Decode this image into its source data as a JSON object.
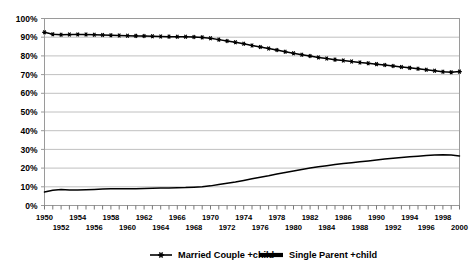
{
  "chart_data": {
    "type": "line",
    "title": "",
    "subtitle": "",
    "xlabel": "",
    "ylabel": "",
    "grid": true,
    "legend_position": "bottom",
    "xlim": [
      1950,
      2000
    ],
    "ylim": [
      0,
      1.0
    ],
    "ytick_labels": [
      "100%",
      "90%",
      "80%",
      "70%",
      "60%",
      "50%",
      "40%",
      "30%",
      "20%",
      "10%",
      "0%"
    ],
    "ytick_values": [
      100,
      90,
      80,
      70,
      60,
      50,
      40,
      30,
      20,
      10,
      0
    ],
    "xtick_labels_top": [
      "1950",
      "1954",
      "1958",
      "1962",
      "1966",
      "1970",
      "1974",
      "1978",
      "1982",
      "1986",
      "1990",
      "1994",
      "1998"
    ],
    "xtick_labels_bottom": [
      "1952",
      "1956",
      "1960",
      "1964",
      "1968",
      "1972",
      "1976",
      "1980",
      "1984",
      "1988",
      "1992",
      "1996",
      "2000"
    ],
    "x": [
      1950,
      1951,
      1952,
      1953,
      1954,
      1955,
      1956,
      1957,
      1958,
      1959,
      1960,
      1961,
      1962,
      1963,
      1964,
      1965,
      1966,
      1967,
      1968,
      1969,
      1970,
      1971,
      1972,
      1973,
      1974,
      1975,
      1976,
      1977,
      1978,
      1979,
      1980,
      1981,
      1982,
      1983,
      1984,
      1985,
      1986,
      1987,
      1988,
      1989,
      1990,
      1991,
      1992,
      1993,
      1994,
      1995,
      1996,
      1997,
      1998,
      1999,
      2000
    ],
    "series": [
      {
        "name": "Married Couple +child",
        "marker": "star",
        "color": "#000000",
        "values": [
          92.6,
          91.6,
          91.3,
          91.4,
          91.5,
          91.4,
          91.3,
          91.2,
          91.0,
          90.9,
          90.8,
          90.7,
          90.6,
          90.5,
          90.4,
          90.3,
          90.2,
          90.2,
          90.1,
          89.9,
          89.4,
          88.7,
          88.0,
          87.3,
          86.5,
          85.6,
          84.8,
          84.0,
          83.1,
          82.2,
          81.4,
          80.6,
          79.9,
          79.2,
          78.6,
          78.0,
          77.5,
          77.0,
          76.5,
          76.1,
          75.6,
          75.1,
          74.6,
          74.1,
          73.6,
          73.1,
          72.6,
          72.1,
          71.5,
          71.3,
          71.6
        ]
      },
      {
        "name": "Single Parent +child",
        "marker": "line",
        "color": "#000000",
        "values": [
          7.2,
          8.2,
          8.6,
          8.3,
          8.3,
          8.4,
          8.6,
          8.8,
          9.0,
          8.9,
          8.9,
          9.0,
          9.1,
          9.2,
          9.3,
          9.4,
          9.5,
          9.6,
          9.8,
          10.0,
          10.5,
          11.2,
          11.9,
          12.6,
          13.4,
          14.3,
          15.1,
          15.9,
          16.8,
          17.7,
          18.5,
          19.3,
          20.0,
          20.7,
          21.3,
          21.9,
          22.4,
          22.9,
          23.4,
          23.8,
          24.3,
          24.8,
          25.3,
          25.7,
          26.1,
          26.4,
          26.7,
          27.0,
          27.2,
          27.0,
          26.5
        ]
      }
    ]
  },
  "legend": {
    "items": [
      {
        "label": "Married Couple +child",
        "marker": "star-line"
      },
      {
        "label": "Single Parent +child",
        "marker": "thick-line"
      }
    ]
  }
}
